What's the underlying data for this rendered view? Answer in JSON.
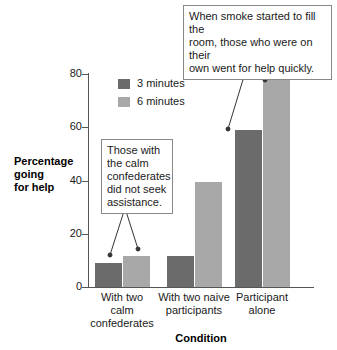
{
  "chart_data": {
    "type": "bar",
    "title": "",
    "subtitle": "",
    "xlabel": "Condition",
    "ylabel": "Percentage going for help",
    "categories": [
      "With two calm confederates",
      "With two naive participants",
      "Participant alone"
    ],
    "category_lines": [
      [
        "With two",
        "calm",
        "confederates"
      ],
      [
        "With two naive",
        "participants"
      ],
      [
        "Participant",
        "alone"
      ]
    ],
    "series": [
      {
        "name": "3 minutes",
        "color": "#6b6b6b",
        "values": [
          9,
          11.5,
          59
        ]
      },
      {
        "name": "6 minutes",
        "color": "#a8a8a8",
        "values": [
          11.5,
          39.5,
          78.5
        ]
      }
    ],
    "ylim": [
      0,
      80
    ],
    "yticks": [
      0,
      20,
      40,
      60,
      80
    ],
    "ytick_labels": [
      "0",
      "20",
      "40",
      "60",
      "80"
    ],
    "grid": false,
    "legend_position": "top-left-inside",
    "annotations": [
      {
        "id": "top",
        "text": "When smoke started to fill the room, those who were on their own went for help quickly.",
        "lines": [
          "When smoke started to fill the",
          "room, those who were on their",
          "own went for help quickly."
        ],
        "points_to": [
          "Participant alone / 3 minutes",
          "Participant alone / 6 minutes"
        ]
      },
      {
        "id": "left",
        "text": "Those with the calm confederates did not seek assistance.",
        "lines": [
          "Those with",
          "the calm",
          "confederates",
          "did not seek",
          "assistance."
        ],
        "points_to": [
          "With two calm confederates / 3 minutes",
          "With two calm confederates / 6 minutes"
        ]
      }
    ]
  },
  "colors": {
    "series_3min": "#6b6b6b",
    "series_6min": "#a8a8a8",
    "axis": "#555555",
    "text": "#1a1a1a",
    "callout_border": "#888888",
    "background": "#ffffff"
  }
}
